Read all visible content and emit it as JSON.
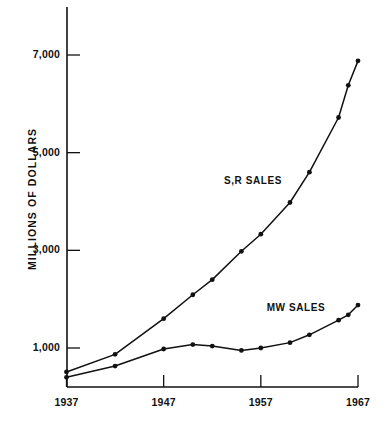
{
  "chart_data": {
    "type": "line",
    "title": "",
    "subtitle": "",
    "xlabel": "",
    "ylabel": "MILLIONS OF DOLLARS",
    "xlim": [
      1937,
      1967
    ],
    "ylim": [
      300,
      7300
    ],
    "grid": false,
    "legend_position": "inline-annotations",
    "x_ticks": [
      "1937",
      "1947",
      "1957",
      "1967"
    ],
    "x_tick_values": [
      1937,
      1947,
      1957,
      1967
    ],
    "y_ticks": [
      "1,000",
      "3,000",
      "5,000",
      "7,000"
    ],
    "y_tick_values": [
      1000,
      3000,
      5000,
      7000
    ],
    "series": [
      {
        "name": "S,R SALES",
        "label": "S,R SALES",
        "color": "#111111",
        "marker": "circle",
        "x": [
          1937,
          1942,
          1947,
          1950,
          1952,
          1955,
          1957,
          1960,
          1962,
          1965,
          1966,
          1967
        ],
        "values": [
          510,
          870,
          1600,
          2090,
          2400,
          2980,
          3330,
          3980,
          4600,
          5720,
          6380,
          6880
        ]
      },
      {
        "name": "MW SALES",
        "label": "MW SALES",
        "color": "#111111",
        "marker": "circle",
        "x": [
          1937,
          1942,
          1947,
          1950,
          1952,
          1955,
          1957,
          1960,
          1962,
          1965,
          1966,
          1967
        ],
        "values": [
          400,
          630,
          980,
          1070,
          1040,
          950,
          1000,
          1110,
          1270,
          1570,
          1680,
          1880
        ]
      }
    ],
    "annotations": [
      {
        "text": "S,R SALES",
        "x": 1953.2,
        "y": 4430
      },
      {
        "text": "MW SALES",
        "x": 1957.6,
        "y": 1820
      }
    ]
  },
  "axes": {
    "y_axis_name": "y-axis",
    "x_axis_name": "x-axis"
  }
}
